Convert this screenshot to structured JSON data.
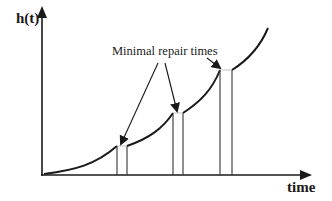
{
  "diagram": {
    "y_axis_label": "h(t)",
    "x_axis_label": "time",
    "annotation": "Minimal repair times",
    "colors": {
      "line": "#1a1a1a",
      "background": "#ffffff"
    },
    "segments": [
      {
        "from_x": 44,
        "from_y": 174,
        "to_x": 117,
        "to_y": 146
      },
      {
        "from_x": 127,
        "from_y": 146,
        "to_x": 173,
        "to_y": 113
      },
      {
        "from_x": 183,
        "from_y": 113,
        "to_x": 220,
        "to_y": 70
      },
      {
        "from_x": 232,
        "from_y": 70,
        "to_x": 268,
        "to_y": 28
      }
    ],
    "repair_intervals": [
      {
        "x_start": 117,
        "x_end": 127,
        "top_y": 146
      },
      {
        "x_start": 173,
        "x_end": 183,
        "top_y": 113
      },
      {
        "x_start": 220,
        "x_end": 232,
        "top_y": 70
      }
    ]
  }
}
